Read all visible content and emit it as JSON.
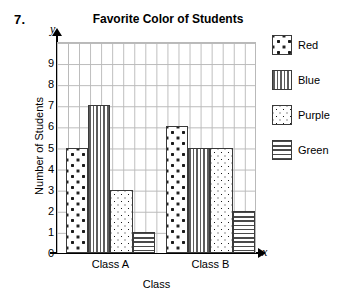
{
  "problem": {
    "number": "7."
  },
  "chart_data": {
    "type": "bar",
    "title": "Favorite Color of Students",
    "xlabel": "Class",
    "ylabel": "Number of Students",
    "x_axis_letter": "x",
    "y_axis_letter": "y",
    "categories": [
      "Class A",
      "Class B"
    ],
    "series": [
      {
        "name": "Red",
        "pattern": "sparse-dots",
        "values": [
          5,
          6
        ]
      },
      {
        "name": "Blue",
        "pattern": "vertical-stripes",
        "values": [
          7,
          5
        ]
      },
      {
        "name": "Purple",
        "pattern": "dense-dots",
        "values": [
          3,
          5
        ]
      },
      {
        "name": "Green",
        "pattern": "horizontal-stripes",
        "values": [
          1,
          2
        ]
      }
    ],
    "ylim": [
      0,
      10
    ],
    "ytick_labels": [
      "9",
      "8",
      "7",
      "6",
      "5",
      "4",
      "3",
      "2",
      "1",
      "0"
    ],
    "grid": true,
    "legend_position": "right"
  },
  "legend": {
    "items": [
      {
        "label": "Red"
      },
      {
        "label": "Blue"
      },
      {
        "label": "Purple"
      },
      {
        "label": "Green"
      }
    ]
  }
}
